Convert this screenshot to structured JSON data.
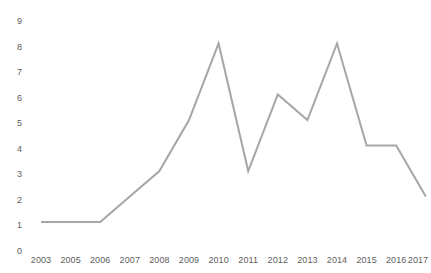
{
  "chart_data": {
    "type": "line",
    "title": "",
    "subtitle": "",
    "xlabel": "",
    "ylabel": "",
    "categories": [
      "2003",
      "2005",
      "2006",
      "2007",
      "2008",
      "2009",
      "2010",
      "2011",
      "2012",
      "2013",
      "2014",
      "2015",
      "2016",
      "2017"
    ],
    "values": [
      1,
      1,
      1,
      2,
      3,
      5,
      8,
      3,
      6,
      5,
      8,
      4,
      4,
      2
    ],
    "series": [
      {
        "name": "",
        "values": [
          1,
          1,
          1,
          2,
          3,
          5,
          8,
          3,
          6,
          5,
          8,
          4,
          4,
          2
        ]
      }
    ],
    "ylim": [
      0,
      9
    ],
    "ytick_labels": [
      "9",
      "8",
      "7",
      "6",
      "5",
      "4",
      "3",
      "2",
      "1",
      "0"
    ],
    "ytick_values": [
      9,
      8,
      7,
      6,
      5,
      4,
      3,
      2,
      1,
      0
    ],
    "grid": false,
    "legend": false,
    "legend_position": "none",
    "markers": false,
    "line_color": "#a6a6a6",
    "axis_text_color": "#5d5d5d",
    "background_color": "#ffffff",
    "annotations": []
  }
}
